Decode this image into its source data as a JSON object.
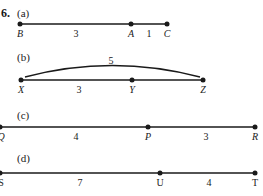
{
  "problem_number": "6.",
  "parts": [
    {
      "label": "(a)",
      "points": [
        {
          "name": "B",
          "x": 20
        },
        {
          "name": "A",
          "x": 131
        },
        {
          "name": "C",
          "x": 167
        }
      ],
      "segment_lengths": [
        "3",
        "1"
      ],
      "arc_length": null
    },
    {
      "label": "(b)",
      "points": [
        {
          "name": "X",
          "x": 21
        },
        {
          "name": "Y",
          "x": 132
        },
        {
          "name": "Z",
          "x": 203
        }
      ],
      "segment_lengths": [
        "3"
      ],
      "arc_length": "5"
    },
    {
      "label": "(c)",
      "points": [
        {
          "name": "Q",
          "x": 0
        },
        {
          "name": "P",
          "x": 148
        },
        {
          "name": "R",
          "x": 255
        }
      ],
      "segment_lengths": [
        "4",
        "3"
      ],
      "arc_length": null
    },
    {
      "label": "(d)",
      "points": [
        {
          "name": "S",
          "x": 0
        },
        {
          "name": "U",
          "x": 160
        },
        {
          "name": "T",
          "x": 255
        }
      ],
      "segment_lengths": [
        "7",
        "4"
      ],
      "arc_length": null
    }
  ],
  "colors": {
    "line": "#1a1a1a",
    "text": "#1a1a1a"
  }
}
